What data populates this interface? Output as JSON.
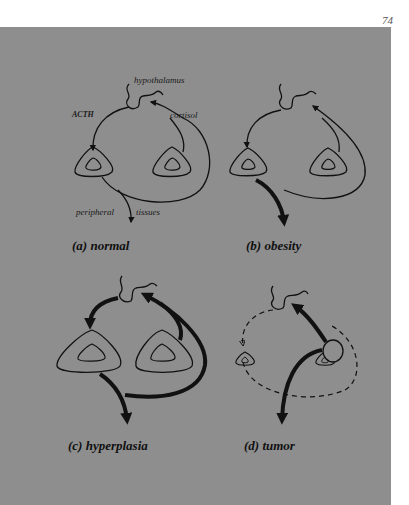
{
  "page": {
    "number": "74"
  },
  "figure": {
    "background_color": "#8e8e8e",
    "line_color": "#111111",
    "panels": [
      {
        "id": "a",
        "caption": "(a) normal",
        "labels": {
          "hypothalamus": "hypothalamus",
          "acth": "ACTH",
          "cortisol": "cortisol",
          "peripheral_tissues_1": "peripheral",
          "peripheral_tissues_2": "tissues"
        }
      },
      {
        "id": "b",
        "caption": "(b) obesity"
      },
      {
        "id": "c",
        "caption": "(c) hyperplasia"
      },
      {
        "id": "d",
        "caption": "(d) tumor"
      }
    ]
  }
}
